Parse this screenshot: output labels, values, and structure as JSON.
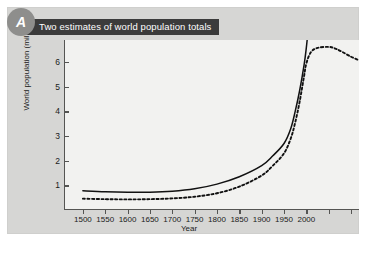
{
  "panel": {
    "badge_label": "A",
    "title": "Two estimates of world population totals"
  },
  "colors": {
    "panel_background": "#d6d6d4",
    "plot_background": "#f2f2f0",
    "banner_background": "#3b3b3b",
    "banner_text": "#ffffff",
    "badge_background": "#8e8e8c",
    "axis": "#555553",
    "curve": "#111111"
  },
  "chart_data": {
    "type": "line",
    "title": "Two estimates of world population totals",
    "xlabel": "Year",
    "ylabel": "World population (millions)",
    "xlim": [
      1460,
      2120
    ],
    "ylim": [
      0,
      6.9
    ],
    "grid": false,
    "legend": "none",
    "x_ticks": [
      1500,
      1550,
      1600,
      1650,
      1700,
      1750,
      1800,
      1850,
      1900,
      1950,
      2000,
      2050,
      2100
    ],
    "x_tick_labels": [
      "1500",
      "1550",
      "1600",
      "1650",
      "1700",
      "1750",
      "1800",
      "1850",
      "1900",
      "1950",
      "2000",
      "",
      ""
    ],
    "y_ticks": [
      1,
      2,
      3,
      4,
      5,
      6
    ],
    "y_tick_labels": [
      "1",
      "2",
      "3",
      "4",
      "5",
      "6"
    ],
    "series": [
      {
        "name": "Higher estimate",
        "style": "solid",
        "x": [
          1500,
          1550,
          1600,
          1650,
          1700,
          1750,
          1800,
          1850,
          1900,
          1925,
          1950,
          1965,
          1975,
          1985,
          1995,
          2000,
          2002
        ],
        "values": [
          0.78,
          0.74,
          0.72,
          0.72,
          0.76,
          0.86,
          1.05,
          1.35,
          1.8,
          2.2,
          2.7,
          3.3,
          4.0,
          4.85,
          5.9,
          6.6,
          6.95
        ]
      },
      {
        "name": "Lower estimate",
        "style": "dotted",
        "x": [
          1500,
          1550,
          1600,
          1650,
          1700,
          1750,
          1800,
          1850,
          1900,
          1925,
          1950,
          1965,
          1975,
          1985,
          1995,
          2000,
          2010,
          2025,
          2050,
          2065,
          2080,
          2100,
          2115
        ],
        "values": [
          0.46,
          0.44,
          0.43,
          0.44,
          0.47,
          0.54,
          0.68,
          0.95,
          1.4,
          1.8,
          2.3,
          2.9,
          3.55,
          4.4,
          5.45,
          5.95,
          6.4,
          6.58,
          6.62,
          6.55,
          6.42,
          6.22,
          6.1
        ]
      }
    ]
  }
}
